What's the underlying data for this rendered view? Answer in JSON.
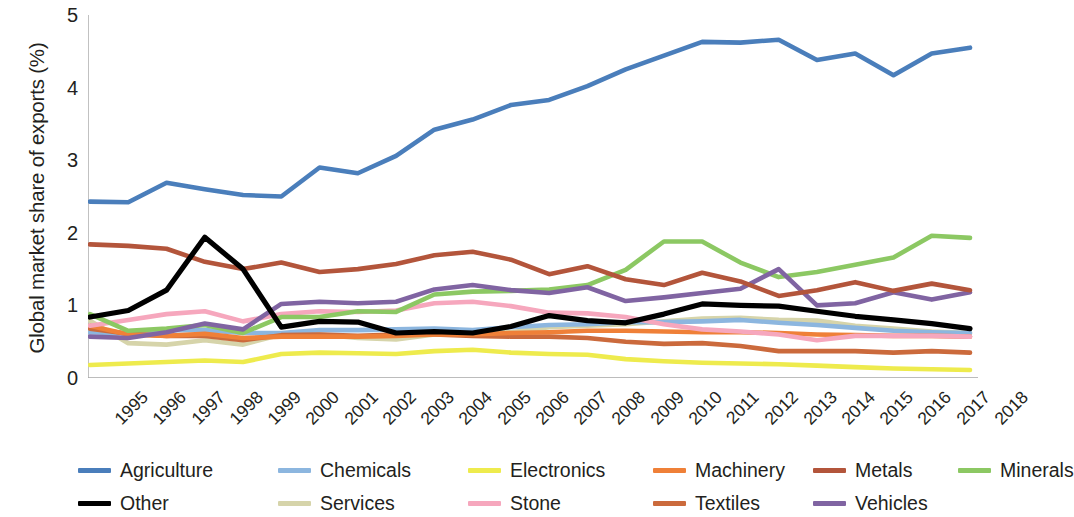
{
  "chart_data": {
    "type": "line",
    "title": "",
    "xlabel": "",
    "ylabel": "Global market share of exports (%)",
    "xlim": [
      1995,
      2018
    ],
    "ylim": [
      0,
      5
    ],
    "yticks": [
      "0",
      "1",
      "2",
      "3",
      "4",
      "5"
    ],
    "grid": false,
    "legend_position": "bottom",
    "categories": [
      "1995",
      "1996",
      "1997",
      "1998",
      "1999",
      "2000",
      "2001",
      "2002",
      "2003",
      "2004",
      "2005",
      "2006",
      "2007",
      "2008",
      "2009",
      "2010",
      "2011",
      "2012",
      "2013",
      "2014",
      "2015",
      "2016",
      "2017",
      "2018"
    ],
    "series": [
      {
        "name": "Agriculture",
        "color": "#4a7ebb",
        "values": [
          2.43,
          2.42,
          2.69,
          2.6,
          2.52,
          2.5,
          2.9,
          2.82,
          3.06,
          3.42,
          3.56,
          3.76,
          3.83,
          4.02,
          4.25,
          4.44,
          4.63,
          4.62,
          4.66,
          4.38,
          4.47,
          4.17,
          4.47,
          4.55
        ]
      },
      {
        "name": "Chemicals",
        "color": "#8cb6df",
        "values": [
          0.63,
          0.61,
          0.66,
          0.66,
          0.62,
          0.62,
          0.66,
          0.66,
          0.67,
          0.68,
          0.66,
          0.7,
          0.73,
          0.74,
          0.77,
          0.77,
          0.78,
          0.8,
          0.76,
          0.73,
          0.69,
          0.65,
          0.63,
          0.62
        ]
      },
      {
        "name": "Electronics",
        "color": "#eeeb4d",
        "values": [
          0.18,
          0.2,
          0.22,
          0.24,
          0.22,
          0.33,
          0.35,
          0.34,
          0.33,
          0.37,
          0.39,
          0.35,
          0.33,
          0.32,
          0.26,
          0.23,
          0.21,
          0.2,
          0.19,
          0.17,
          0.15,
          0.13,
          0.12,
          0.11
        ]
      },
      {
        "name": "Machinery",
        "color": "#ef8038",
        "values": [
          0.72,
          0.6,
          0.58,
          0.61,
          0.55,
          0.57,
          0.57,
          0.57,
          0.58,
          0.6,
          0.6,
          0.62,
          0.63,
          0.65,
          0.65,
          0.64,
          0.63,
          0.63,
          0.62,
          0.6,
          0.59,
          0.58,
          0.58,
          0.57
        ]
      },
      {
        "name": "Metals",
        "color": "#b3553b"
      },
      {
        "name": "Minerals",
        "color": "#8cc863"
      },
      {
        "name": "Other",
        "color": "#000000"
      },
      {
        "name": "Services",
        "color": "#d6d4aa"
      },
      {
        "name": "Stone",
        "color": "#f6a7bd"
      },
      {
        "name": "Textiles",
        "color": "#cb6a3c"
      },
      {
        "name": "Vehicles",
        "color": "#8064a2"
      }
    ],
    "series_values": {
      "Metals": [
        1.84,
        1.82,
        1.78,
        1.6,
        1.5,
        1.59,
        1.46,
        1.5,
        1.57,
        1.69,
        1.74,
        1.63,
        1.43,
        1.54,
        1.36,
        1.28,
        1.45,
        1.33,
        1.13,
        1.21,
        1.32,
        1.2,
        1.3,
        1.21
      ],
      "Minerals": [
        0.88,
        0.65,
        0.68,
        0.73,
        0.62,
        0.84,
        0.84,
        0.92,
        0.91,
        1.15,
        1.19,
        1.2,
        1.22,
        1.28,
        1.49,
        1.88,
        1.88,
        1.59,
        1.39,
        1.46,
        1.56,
        1.66,
        1.96,
        1.93
      ],
      "Other": [
        0.84,
        0.93,
        1.21,
        1.94,
        1.5,
        0.7,
        0.78,
        0.77,
        0.62,
        0.64,
        0.62,
        0.71,
        0.86,
        0.79,
        0.76,
        0.88,
        1.02,
        1.0,
        0.99,
        0.92,
        0.85,
        0.8,
        0.75,
        0.68
      ]
    },
    "series_values2": {
      "Services": [
        0.79,
        0.48,
        0.46,
        0.52,
        0.46,
        0.6,
        0.6,
        0.55,
        0.53,
        0.6,
        0.63,
        0.63,
        0.7,
        0.72,
        0.74,
        0.78,
        0.82,
        0.83,
        0.8,
        0.79,
        0.72,
        0.68,
        0.64,
        0.62
      ]
    },
    "series_values3": {
      "Stone": [
        0.72,
        0.8,
        0.88,
        0.92,
        0.78,
        0.88,
        0.92,
        0.91,
        0.93,
        1.03,
        1.05,
        0.99,
        0.9,
        0.89,
        0.84,
        0.74,
        0.67,
        0.64,
        0.6,
        0.52,
        0.58,
        0.58,
        0.58,
        0.57
      ]
    },
    "series_values4": {
      "Textiles": [
        0.68,
        0.61,
        0.58,
        0.58,
        0.52,
        0.59,
        0.6,
        0.58,
        0.6,
        0.6,
        0.58,
        0.57,
        0.57,
        0.55,
        0.5,
        0.47,
        0.48,
        0.44,
        0.37,
        0.37,
        0.37,
        0.35,
        0.37,
        0.35
      ]
    },
    "series_values5": {
      "Vehicles": [
        0.57,
        0.55,
        0.63,
        0.75,
        0.67,
        1.02,
        1.05,
        1.03,
        1.05,
        1.22,
        1.28,
        1.21,
        1.17,
        1.25,
        1.06,
        1.11,
        1.17,
        1.23,
        1.5,
        1.0,
        1.03,
        1.18,
        1.08,
        1.18
      ]
    }
  },
  "legend": {
    "items": [
      {
        "label": "Agriculture"
      },
      {
        "label": "Chemicals"
      },
      {
        "label": "Electronics"
      },
      {
        "label": "Machinery"
      },
      {
        "label": "Metals"
      },
      {
        "label": "Minerals"
      },
      {
        "label": "Other"
      },
      {
        "label": "Services"
      },
      {
        "label": "Stone"
      },
      {
        "label": "Textiles"
      },
      {
        "label": "Vehicles"
      }
    ]
  },
  "axes": {
    "y_title": "Global market share of exports (%)"
  }
}
